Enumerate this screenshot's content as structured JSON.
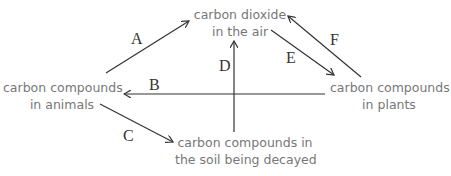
{
  "diagram": {
    "title": "",
    "nodes": {
      "air": {
        "line1": "carbon dioxide",
        "line2": "in the air"
      },
      "animals": {
        "line1": "carbon compounds",
        "line2": "in animals"
      },
      "plants": {
        "line1": "carbon compounds",
        "line2": "in plants"
      },
      "soil": {
        "line1": "carbon compounds in",
        "line2": "the soil being decayed"
      }
    },
    "arrows": [
      {
        "label": "A",
        "from": "carbon compounds in animals",
        "to": "carbon dioxide in the air"
      },
      {
        "label": "B",
        "from": "carbon compounds in plants",
        "to": "carbon compounds in animals"
      },
      {
        "label": "C",
        "from": "carbon compounds in animals",
        "to": "carbon compounds in the soil being decayed"
      },
      {
        "label": "D",
        "from": "carbon compounds in the soil being decayed",
        "to": "carbon dioxide in the air"
      },
      {
        "label": "E",
        "from": "carbon dioxide in the air",
        "to": "carbon compounds in plants"
      },
      {
        "label": "F",
        "from": "carbon compounds in plants",
        "to": "carbon dioxide in the air"
      }
    ],
    "colors": {
      "text": "#777777",
      "arrow": "#333333"
    }
  }
}
